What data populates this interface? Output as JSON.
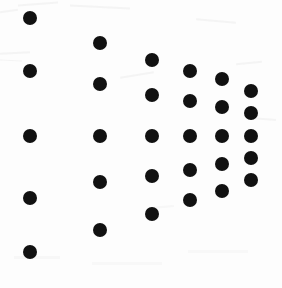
{
  "image": {
    "title": "Dot fan pattern",
    "background_color": "#fdfdfd",
    "dot_color": "#111111",
    "width": 282,
    "height": 288,
    "dot_count": 30,
    "column_count": 6,
    "row_count": 5
  },
  "chart_data": {
    "type": "scatter",
    "subtitle": "",
    "xlabel": "",
    "ylabel": "",
    "xlim": [
      0,
      282
    ],
    "ylim": [
      0,
      288
    ],
    "grid": false,
    "legend": "none",
    "marker": "filled-circle",
    "marker_color": "#111111",
    "columns": [
      {
        "name": "column-1",
        "x": 30,
        "diameter": 14,
        "y": [
          18,
          71,
          136,
          198,
          252
        ]
      },
      {
        "name": "column-2",
        "x": 100,
        "diameter": 14,
        "y": [
          43,
          84,
          136,
          182,
          230
        ]
      },
      {
        "name": "column-3",
        "x": 152,
        "diameter": 14,
        "y": [
          60,
          95,
          136,
          176,
          214
        ]
      },
      {
        "name": "column-4",
        "x": 190,
        "diameter": 14,
        "y": [
          71,
          101,
          136,
          170,
          200
        ]
      },
      {
        "name": "column-5",
        "x": 222,
        "diameter": 14,
        "y": [
          79,
          107,
          136,
          164,
          191
        ]
      },
      {
        "name": "column-6",
        "x": 251,
        "diameter": 14,
        "y": [
          91,
          113,
          136,
          158,
          180
        ]
      }
    ],
    "points": [
      {
        "x": 30,
        "y": 18
      },
      {
        "x": 30,
        "y": 71
      },
      {
        "x": 30,
        "y": 136
      },
      {
        "x": 30,
        "y": 198
      },
      {
        "x": 30,
        "y": 252
      },
      {
        "x": 100,
        "y": 43
      },
      {
        "x": 100,
        "y": 84
      },
      {
        "x": 100,
        "y": 136
      },
      {
        "x": 100,
        "y": 182
      },
      {
        "x": 100,
        "y": 230
      },
      {
        "x": 152,
        "y": 60
      },
      {
        "x": 152,
        "y": 95
      },
      {
        "x": 152,
        "y": 136
      },
      {
        "x": 152,
        "y": 176
      },
      {
        "x": 152,
        "y": 214
      },
      {
        "x": 190,
        "y": 71
      },
      {
        "x": 190,
        "y": 101
      },
      {
        "x": 190,
        "y": 136
      },
      {
        "x": 190,
        "y": 170
      },
      {
        "x": 190,
        "y": 200
      },
      {
        "x": 222,
        "y": 79
      },
      {
        "x": 222,
        "y": 107
      },
      {
        "x": 222,
        "y": 136
      },
      {
        "x": 222,
        "y": 164
      },
      {
        "x": 222,
        "y": 191
      },
      {
        "x": 251,
        "y": 91
      },
      {
        "x": 251,
        "y": 113
      },
      {
        "x": 251,
        "y": 136
      },
      {
        "x": 251,
        "y": 158
      },
      {
        "x": 251,
        "y": 180
      }
    ]
  }
}
